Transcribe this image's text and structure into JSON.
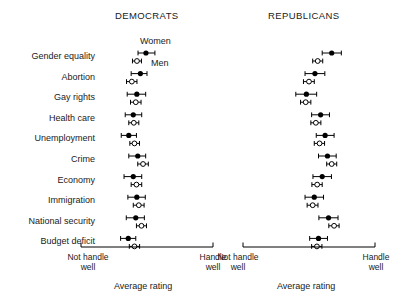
{
  "figure": {
    "panels": [
      {
        "id": "democrats",
        "title": "DEMOCRATS",
        "axis_title": "Average rating",
        "axis_left_label": "Not handle well",
        "axis_right_label": "Handle well"
      },
      {
        "id": "republicans",
        "title": "REPUBLICANS",
        "axis_title": "Average rating",
        "axis_left_label": "Not handle well",
        "axis_right_label": "Handle well"
      }
    ],
    "annotations": [
      {
        "name": "women-series-label",
        "text": "Women"
      },
      {
        "name": "men-series-label",
        "text": "Men"
      }
    ],
    "issues": [
      "Gender equality",
      "Abortion",
      "Gay rights",
      "Health care",
      "Unemployment",
      "Crime",
      "Economy",
      "Immigration",
      "National security",
      "Budget deficit"
    ]
  },
  "chart_data": {
    "type": "scatter",
    "title": "",
    "subtitle": "",
    "xlabel": "Average rating",
    "ylabel": "",
    "grid": false,
    "legend_position": "inline-annotation",
    "legend": [
      "Women",
      "Men"
    ],
    "xlim": [
      0,
      1
    ],
    "xtick_labels": [
      "Not handle well",
      "Handle well"
    ],
    "categories": [
      "Gender equality",
      "Abortion",
      "Gay rights",
      "Health care",
      "Unemployment",
      "Crime",
      "Economy",
      "Immigration",
      "National security",
      "Budget deficit"
    ],
    "panels": [
      {
        "name": "DEMOCRATS",
        "series": [
          {
            "name": "Women",
            "marker": "filled-circle",
            "values": [
              0.492,
              0.45,
              0.423,
              0.396,
              0.362,
              0.43,
              0.396,
              0.423,
              0.415,
              0.358
            ],
            "ci_low": [
              0.432,
              0.38,
              0.35,
              0.335,
              0.305,
              0.362,
              0.326,
              0.355,
              0.343,
              0.3
            ],
            "ci_high": [
              0.56,
              0.5,
              0.49,
              0.46,
              0.42,
              0.49,
              0.46,
              0.487,
              0.48,
              0.415
            ]
          },
          {
            "name": "Men",
            "marker": "open-circle",
            "values": [
              0.424,
              0.385,
              0.415,
              0.4,
              0.405,
              0.47,
              0.42,
              0.438,
              0.458,
              0.405
            ],
            "ci_low": [
              0.39,
              0.345,
              0.375,
              0.362,
              0.37,
              0.43,
              0.38,
              0.396,
              0.42,
              0.366
            ],
            "ci_high": [
              0.458,
              0.424,
              0.455,
              0.438,
              0.443,
              0.51,
              0.46,
              0.478,
              0.496,
              0.444
            ]
          }
        ]
      },
      {
        "name": "REPUBLICANS",
        "series": [
          {
            "name": "Women",
            "marker": "filled-circle",
            "values": [
              0.672,
              0.545,
              0.48,
              0.588,
              0.622,
              0.64,
              0.6,
              0.54,
              0.648,
              0.572
            ],
            "ci_low": [
              0.6,
              0.47,
              0.4,
              0.52,
              0.555,
              0.572,
              0.53,
              0.47,
              0.575,
              0.505
            ],
            "ci_high": [
              0.745,
              0.62,
              0.558,
              0.655,
              0.69,
              0.706,
              0.67,
              0.61,
              0.72,
              0.64
            ]
          },
          {
            "name": "Men",
            "marker": "open-circle",
            "values": [
              0.566,
              0.5,
              0.475,
              0.552,
              0.58,
              0.672,
              0.562,
              0.528,
              0.69,
              0.56
            ],
            "ci_low": [
              0.528,
              0.458,
              0.436,
              0.514,
              0.54,
              0.634,
              0.522,
              0.486,
              0.65,
              0.52
            ],
            "ci_high": [
              0.604,
              0.54,
              0.514,
              0.59,
              0.618,
              0.71,
              0.6,
              0.568,
              0.728,
              0.598
            ]
          }
        ]
      }
    ]
  }
}
